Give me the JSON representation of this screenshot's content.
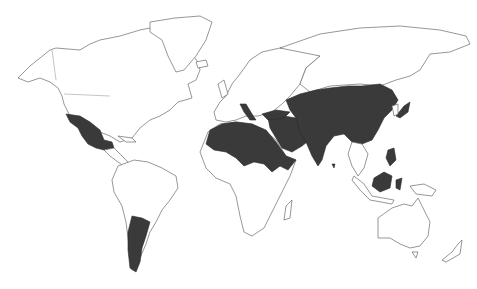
{
  "map": {
    "type": "world-choropleth",
    "projection": "miller-like",
    "colors": {
      "background": "#ffffff",
      "land": "#ffffff",
      "outline": "#6a6a6a",
      "highlighted": "#3a3a3a"
    },
    "highlighted_regions": [
      "Mexico",
      "Argentina",
      "Italy",
      "Morocco",
      "Algeria",
      "Libya",
      "Egypt",
      "Sudan",
      "Ethiopia",
      "Somalia",
      "Turkey",
      "Saudi Arabia",
      "Iraq",
      "Syria",
      "Iran",
      "Kazakhstan",
      "Uzbekistan",
      "Turkmenistan",
      "Afghanistan",
      "Pakistan",
      "India",
      "China",
      "Mongolia",
      "Japan",
      "Philippines",
      "Indonesia",
      "Malaysia (Borneo)"
    ]
  }
}
